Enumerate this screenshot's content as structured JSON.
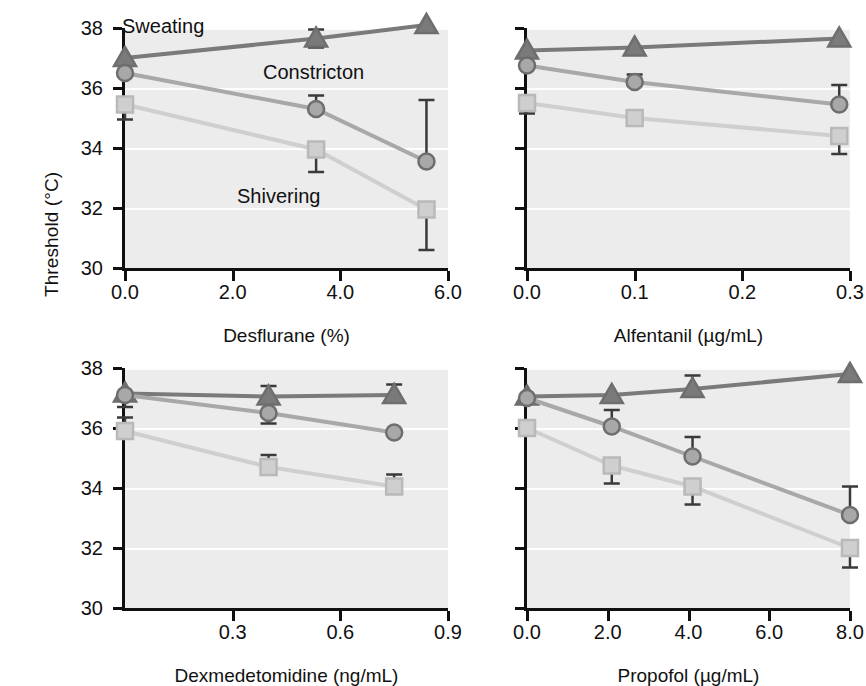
{
  "figure": {
    "ylabel": "Threshold (°C)",
    "y_ticks": [
      "30",
      "32",
      "34",
      "36",
      "38"
    ],
    "series_labels": {
      "sweating": "Sweating",
      "constriction": "Constricton",
      "shivering": "Shivering"
    },
    "colors": {
      "sweating": "#7a7a7a",
      "constriction": "#a8a8a8",
      "shivering": "#cfcfcf",
      "plot_background": "#ececed",
      "gridline": "#fdfdfd",
      "axis": "#101010",
      "text": "#111111"
    }
  },
  "chart_data": [
    {
      "type": "line",
      "panel": "top-left",
      "title": "",
      "xlabel": "Desflurane (%)",
      "ylabel": "Threshold (°C)",
      "xlim": [
        0.0,
        6.0
      ],
      "ylim": [
        30,
        38
      ],
      "xticks": [
        0.0,
        2.0,
        4.0,
        6.0
      ],
      "xticklabels": [
        "0.0",
        "2.0",
        "4.0",
        "6.0"
      ],
      "yticks": [
        30,
        32,
        34,
        36,
        38
      ],
      "grid": true,
      "legend": "in-plot annotations",
      "series": [
        {
          "name": "Sweating",
          "marker": "triangle",
          "color": "#7a7a7a",
          "x": [
            0.0,
            3.55,
            5.6
          ],
          "values": [
            37.0,
            37.65,
            38.1
          ],
          "err_low": [
            0.0,
            0.3,
            0.0
          ],
          "err_high": [
            0.0,
            0.3,
            0.0
          ]
        },
        {
          "name": "Constricton",
          "marker": "circle",
          "color": "#a8a8a8",
          "x": [
            0.0,
            3.55,
            5.6
          ],
          "values": [
            36.5,
            35.3,
            33.55
          ],
          "err_low": [
            0.0,
            0.0,
            0.0
          ],
          "err_high": [
            0.0,
            0.45,
            2.05
          ]
        },
        {
          "name": "Shivering",
          "marker": "square",
          "color": "#cfcfcf",
          "x": [
            0.0,
            3.55,
            5.6
          ],
          "values": [
            35.45,
            33.95,
            31.95
          ],
          "err_low": [
            0.5,
            0.75,
            1.35
          ],
          "err_high": [
            0.0,
            0.0,
            0.0
          ]
        }
      ]
    },
    {
      "type": "line",
      "panel": "top-right",
      "title": "",
      "xlabel": "Alfentanil (µg/mL)",
      "ylabel": "Threshold (°C)",
      "xlim": [
        0.0,
        0.3
      ],
      "ylim": [
        30,
        38
      ],
      "xticks": [
        0.0,
        0.1,
        0.2,
        0.3
      ],
      "xticklabels": [
        "0.0",
        "0.1",
        "0.2",
        "0.3"
      ],
      "yticks": [
        30,
        32,
        34,
        36,
        38
      ],
      "grid": true,
      "series": [
        {
          "name": "Sweating",
          "marker": "triangle",
          "color": "#7a7a7a",
          "x": [
            0.0,
            0.1,
            0.29
          ],
          "values": [
            37.25,
            37.35,
            37.65
          ],
          "err_low": [
            0.0,
            0.0,
            0.0
          ],
          "err_high": [
            0.0,
            0.0,
            0.0
          ]
        },
        {
          "name": "Constricton",
          "marker": "circle",
          "color": "#a8a8a8",
          "x": [
            0.0,
            0.1,
            0.29
          ],
          "values": [
            36.75,
            36.2,
            35.45
          ],
          "err_low": [
            0.0,
            0.0,
            0.0
          ],
          "err_high": [
            0.0,
            0.25,
            0.65
          ]
        },
        {
          "name": "Shivering",
          "marker": "square",
          "color": "#cfcfcf",
          "x": [
            0.0,
            0.1,
            0.29
          ],
          "values": [
            35.5,
            35.0,
            34.4
          ],
          "err_low": [
            0.35,
            0.0,
            0.6
          ],
          "err_high": [
            0.0,
            0.0,
            0.0
          ]
        }
      ]
    },
    {
      "type": "line",
      "panel": "bottom-left",
      "title": "",
      "xlabel": "Dexmedetomidine (ng/mL)",
      "ylabel": "Threshold (°C)",
      "xlim": [
        0.0,
        0.9
      ],
      "ylim": [
        30,
        38
      ],
      "xticks": [
        0.3,
        0.6,
        0.9
      ],
      "xticklabels": [
        "0.3",
        "0.6",
        "0.9"
      ],
      "yticks": [
        30,
        32,
        34,
        36,
        38
      ],
      "grid": true,
      "series": [
        {
          "name": "Sweating",
          "marker": "triangle",
          "color": "#7a7a7a",
          "x": [
            0.0,
            0.4,
            0.75
          ],
          "values": [
            37.15,
            37.05,
            37.1
          ],
          "err_low": [
            0.45,
            0.0,
            0.0
          ],
          "err_high": [
            0.0,
            0.35,
            0.35
          ]
        },
        {
          "name": "Constricton",
          "marker": "circle",
          "color": "#a8a8a8",
          "x": [
            0.0,
            0.4,
            0.75
          ],
          "values": [
            37.1,
            36.5,
            35.85
          ],
          "err_low": [
            0.0,
            0.35,
            0.0
          ],
          "err_high": [
            0.0,
            0.0,
            0.0
          ]
        },
        {
          "name": "Shivering",
          "marker": "square",
          "color": "#cfcfcf",
          "x": [
            0.0,
            0.4,
            0.75
          ],
          "values": [
            35.9,
            34.7,
            34.05
          ],
          "err_low": [
            0.0,
            0.0,
            0.0
          ],
          "err_high": [
            0.45,
            0.4,
            0.4
          ]
        }
      ]
    },
    {
      "type": "line",
      "panel": "bottom-right",
      "title": "",
      "xlabel": "Propofol (µg/mL)",
      "ylabel": "Threshold (°C)",
      "xlim": [
        0.0,
        8.0
      ],
      "ylim": [
        30,
        38
      ],
      "xticks": [
        0.0,
        2.0,
        4.0,
        6.0,
        8.0
      ],
      "xticklabels": [
        "0.0",
        "2.0",
        "4.0",
        "6.0",
        "8.0"
      ],
      "yticks": [
        30,
        32,
        34,
        36,
        38
      ],
      "grid": true,
      "series": [
        {
          "name": "Sweating",
          "marker": "triangle",
          "color": "#7a7a7a",
          "x": [
            0.0,
            2.1,
            4.1,
            8.0
          ],
          "values": [
            37.05,
            37.1,
            37.3,
            37.8
          ],
          "err_low": [
            0.0,
            0.0,
            0.0,
            0.0
          ],
          "err_high": [
            0.0,
            0.0,
            0.45,
            0.0
          ]
        },
        {
          "name": "Constricton",
          "marker": "circle",
          "color": "#a8a8a8",
          "x": [
            0.0,
            2.1,
            4.1,
            8.0
          ],
          "values": [
            37.0,
            36.05,
            35.05,
            33.1
          ],
          "err_low": [
            0.0,
            0.0,
            0.0,
            0.0
          ],
          "err_high": [
            0.0,
            0.55,
            0.65,
            0.95
          ]
        },
        {
          "name": "Shivering",
          "marker": "square",
          "color": "#cfcfcf",
          "x": [
            0.0,
            2.1,
            4.1,
            8.0
          ],
          "values": [
            36.0,
            34.75,
            34.05,
            32.0
          ],
          "err_low": [
            0.0,
            0.6,
            0.6,
            0.65
          ],
          "err_high": [
            0.0,
            0.0,
            0.0,
            0.0
          ]
        }
      ]
    }
  ],
  "annotations": {
    "top_left": [
      {
        "text": "Sweating",
        "x": 122,
        "y": 16
      },
      {
        "text": "Constricton",
        "x": 263,
        "y": 62
      },
      {
        "text": "Shivering",
        "x": 237,
        "y": 186
      }
    ]
  }
}
